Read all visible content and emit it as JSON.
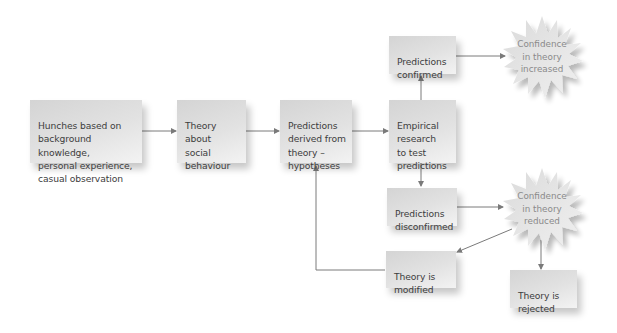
{
  "diagram": {
    "title": "",
    "colors": {
      "box_fill": "#dcdcdc",
      "box_text": "#3d3d3d",
      "burst_fill": "#e4e4e4",
      "burst_text": "#8a8a8a",
      "arrow": "#7a7a7a"
    },
    "nodes": {
      "hunches": {
        "label": "Hunches based on\nbackground knowledge,\npersonal experience,\ncasual observation"
      },
      "theory": {
        "label": "Theory\nabout\nsocial\nbehaviour"
      },
      "hypotheses": {
        "label": "Predictions\nderived from\ntheory –\nhypotheses"
      },
      "empirical": {
        "label": "Empirical\nresearch\nto test\npredictions"
      },
      "confirmed": {
        "label": "Predictions\nconfirmed"
      },
      "disconfirmed": {
        "label": "Predictions\ndisconfirmed"
      },
      "confidence_increased": {
        "label": "Confidence\nin theory\nincreased"
      },
      "confidence_reduced": {
        "label": "Confidence\nin theory\nreduced"
      },
      "modified": {
        "label": "Theory is\nmodified"
      },
      "rejected": {
        "label": "Theory is\nrejected"
      }
    },
    "edges": [
      {
        "from": "hunches",
        "to": "theory"
      },
      {
        "from": "theory",
        "to": "hypotheses"
      },
      {
        "from": "hypotheses",
        "to": "empirical"
      },
      {
        "from": "empirical",
        "to": "confirmed"
      },
      {
        "from": "empirical",
        "to": "disconfirmed"
      },
      {
        "from": "confirmed",
        "to": "confidence_increased"
      },
      {
        "from": "disconfirmed",
        "to": "confidence_reduced"
      },
      {
        "from": "confidence_reduced",
        "to": "modified"
      },
      {
        "from": "confidence_reduced",
        "to": "rejected"
      },
      {
        "from": "modified",
        "to": "hypotheses"
      }
    ]
  }
}
